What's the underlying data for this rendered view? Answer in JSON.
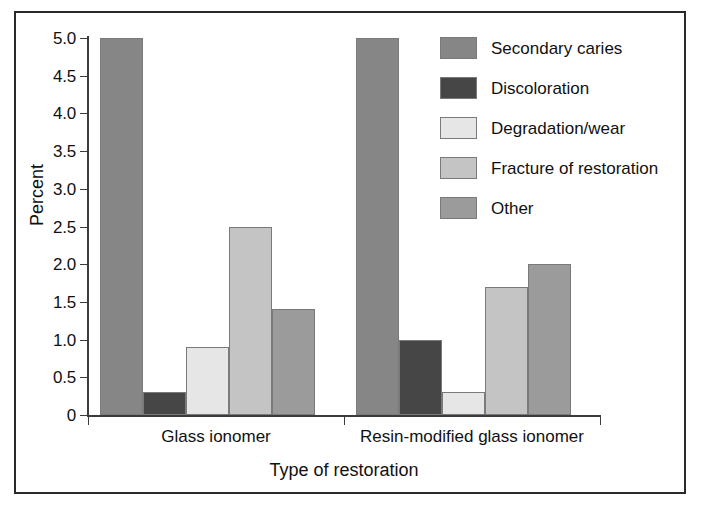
{
  "figure": {
    "border_color": "#2a2a2a",
    "background": "#ffffff"
  },
  "chart_data": {
    "type": "bar",
    "title": "",
    "xlabel": "Type of restoration",
    "ylabel": "Percent",
    "categories": [
      "Glass ionomer",
      "Resin-modified glass ionomer"
    ],
    "ylim": [
      0,
      5.0
    ],
    "ytick_labels": [
      "5.0",
      "4.5",
      "4.0",
      "3.5",
      "3.0",
      "2.5",
      "2.0",
      "1.5",
      "1.0",
      "0.5",
      "0"
    ],
    "ytick_values": [
      5.0,
      4.5,
      4.0,
      3.5,
      3.0,
      2.5,
      2.0,
      1.5,
      1.0,
      0.5,
      0
    ],
    "grid": false,
    "legend_position": "upper-right-inside",
    "series": [
      {
        "name": "Secondary caries",
        "color": "#868686",
        "values": [
          5.0,
          5.0
        ]
      },
      {
        "name": "Discoloration",
        "color": "#464646",
        "values": [
          0.3,
          1.0
        ]
      },
      {
        "name": "Degradation/wear",
        "color": "#e6e6e6",
        "values": [
          0.9,
          0.3
        ]
      },
      {
        "name": "Fracture of restoration",
        "color": "#c4c4c4",
        "values": [
          2.5,
          1.7
        ]
      },
      {
        "name": "Other",
        "color": "#9b9b9b",
        "values": [
          1.4,
          2.0
        ]
      }
    ]
  },
  "caption_remnant": "",
  "icons": {
    "legend_swatch": "color-swatch-icon"
  }
}
